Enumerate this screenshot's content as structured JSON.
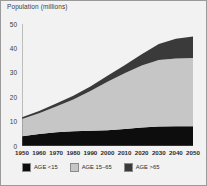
{
  "chart_data": {
    "type": "area",
    "stacked": true,
    "title": "Population (millions)",
    "xlabel": "",
    "ylabel": "Population (millions)",
    "x": [
      1950,
      1960,
      1970,
      1980,
      1990,
      2000,
      2010,
      2020,
      2030,
      2040,
      2050
    ],
    "xtick_labels": [
      "1950",
      "1960",
      "1970",
      "1980",
      "1990",
      "2000",
      "2010",
      "2020",
      "2030",
      "2040",
      "2050"
    ],
    "ytick_labels": [
      "0",
      "10",
      "20",
      "30",
      "40",
      "50"
    ],
    "yticks": [
      0,
      10,
      20,
      30,
      40,
      50
    ],
    "ylim": [
      0,
      50
    ],
    "xlim": [
      1950,
      2050
    ],
    "grid": false,
    "legend_position": "bottom",
    "series": [
      {
        "name": "AGE <15",
        "color": "#0d0d0d",
        "values": [
          4.0,
          4.9,
          5.6,
          6.0,
          6.2,
          6.5,
          7.0,
          7.6,
          8.0,
          8.1,
          8.1
        ]
      },
      {
        "name": "AGE 15-65",
        "color": "#c6c6c6",
        "values": [
          7.1,
          8.5,
          10.6,
          13.1,
          16.3,
          19.8,
          22.8,
          25.4,
          27.2,
          27.8,
          28.0
        ]
      },
      {
        "name": "AGE >65",
        "color": "#3a3a3a",
        "values": [
          0.7,
          0.9,
          1.2,
          1.5,
          1.9,
          2.5,
          3.3,
          4.6,
          6.6,
          8.1,
          8.8
        ]
      }
    ],
    "totals": [
      11.8,
      14.3,
      17.4,
      20.6,
      24.4,
      28.8,
      33.1,
      37.6,
      41.8,
      44.0,
      44.9
    ]
  },
  "legend": {
    "items": [
      {
        "label": "AGE  <15",
        "color": "#0d0d0d"
      },
      {
        "label": "AGE  15–65",
        "color": "#c6c6c6"
      },
      {
        "label": "AGE  >65",
        "color": "#3a3a3a"
      }
    ]
  },
  "colors": {
    "background": "#f2f2f2",
    "border": "#9a9a9a",
    "text": "#2b2b2b",
    "axis": "#6e6e6e"
  }
}
